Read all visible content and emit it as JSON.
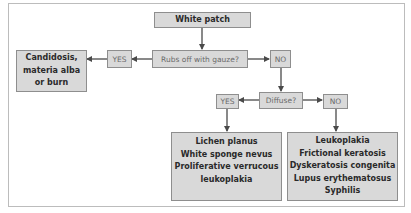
{
  "diagram": {
    "type": "flowchart",
    "colors": {
      "box_fill": "#d9d9d9",
      "box_border": "#8e8e8e",
      "arrow": "#4a4a4a",
      "frame": "#bcbcbc"
    },
    "nodes": {
      "start": {
        "label": "White patch"
      },
      "q1": {
        "label": "Rubs off with gauze?"
      },
      "q1_yes": {
        "label": "YES"
      },
      "q1_no": {
        "label": "NO"
      },
      "result_yes1": {
        "lines": [
          "Candidosis,",
          "materia alba",
          "or burn"
        ]
      },
      "q2": {
        "label": "Diffuse?"
      },
      "q2_yes": {
        "label": "YES"
      },
      "q2_no": {
        "label": "NO"
      },
      "result_yes2": {
        "lines": [
          "Lichen planus",
          "White sponge nevus",
          "Proliferative verrucous",
          "leukoplakia"
        ]
      },
      "result_no2": {
        "lines": [
          "Leukoplakia",
          "Frictional keratosis",
          "Dyskeratosis congenita",
          "Lupus erythematosus",
          "Syphilis"
        ]
      }
    },
    "edges": [
      {
        "from": "start",
        "to": "q1"
      },
      {
        "from": "q1",
        "to": "q1_yes"
      },
      {
        "from": "q1_yes",
        "to": "result_yes1"
      },
      {
        "from": "q1",
        "to": "q1_no"
      },
      {
        "from": "q1_no",
        "to": "q2"
      },
      {
        "from": "q2",
        "to": "q2_yes"
      },
      {
        "from": "q2_yes",
        "to": "result_yes2"
      },
      {
        "from": "q2",
        "to": "q2_no"
      },
      {
        "from": "q2_no",
        "to": "result_no2"
      }
    ]
  }
}
